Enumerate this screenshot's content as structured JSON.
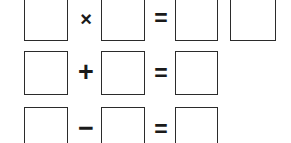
{
  "worksheet": {
    "title": "Math equation boxes worksheet",
    "background_color": "#ffffff",
    "box_border_color": "#2b2b2b",
    "operator_color": "#1a1a1a",
    "width": 291,
    "height": 143,
    "row_count": 3
  },
  "rows": [
    {
      "id": "row-multiplication",
      "operator_label": "×",
      "operator_name": "multiplication",
      "equals_label": "=",
      "box_count": 5,
      "clipped": "top",
      "boxes": [
        {
          "label": "",
          "role": "operand-1"
        },
        {
          "label": "",
          "role": "operand-2"
        },
        {
          "label": "",
          "role": "result-tens"
        },
        {
          "label": "",
          "role": "result-ones"
        }
      ]
    },
    {
      "id": "row-addition",
      "operator_label": "+",
      "operator_name": "addition",
      "equals_label": "=",
      "box_count": 3,
      "clipped": "none",
      "boxes": [
        {
          "label": "",
          "role": "operand-1"
        },
        {
          "label": "",
          "role": "operand-2"
        },
        {
          "label": "",
          "role": "result"
        }
      ]
    },
    {
      "id": "row-subtraction",
      "operator_label": "−",
      "operator_name": "subtraction",
      "equals_label": "=",
      "box_count": 3,
      "clipped": "bottom",
      "boxes": [
        {
          "label": "",
          "role": "operand-1"
        },
        {
          "label": "",
          "role": "operand-2"
        },
        {
          "label": "",
          "role": "result"
        }
      ]
    }
  ]
}
